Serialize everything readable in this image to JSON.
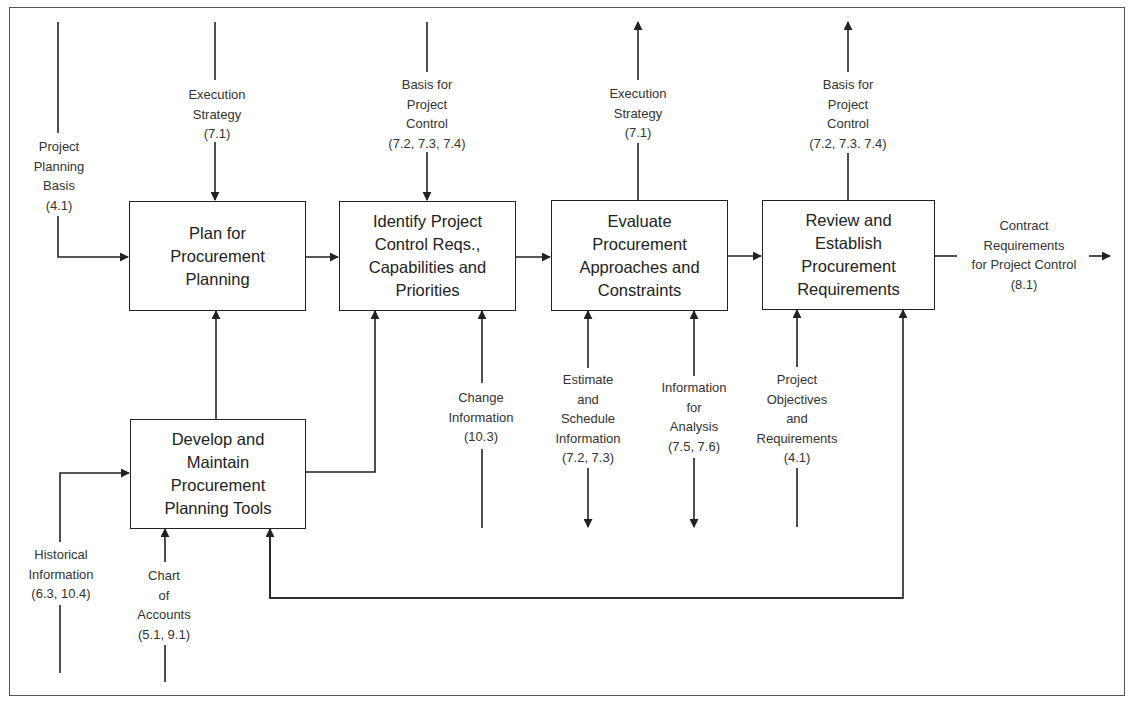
{
  "process_boxes": [
    {
      "id": "plan",
      "label": "Plan for\nProcurement\nPlanning"
    },
    {
      "id": "identify",
      "label": "Identify Project\nControl Reqs.,\nCapabilities and\nPriorities"
    },
    {
      "id": "evaluate",
      "label": "Evaluate\nProcurement\nApproaches and\nConstraints"
    },
    {
      "id": "review",
      "label": "Review and\nEstablish\nProcurement\nRequirements"
    },
    {
      "id": "develop",
      "label": "Develop and\nMaintain\nProcurement\nPlanning Tools"
    }
  ],
  "flow_labels": {
    "project_planning_basis": "Project\nPlanning\nBasis\n(4.1)",
    "execution_strategy_in": "Execution\nStrategy\n(7.1)",
    "basis_for_control_in": "Basis for\nProject\nControl\n(7.2, 7.3, 7.4)",
    "execution_strategy_out": "Execution\nStrategy\n(7.1)",
    "basis_for_control_out": "Basis for\nProject\nControl\n(7.2, 7.3. 7.4)",
    "contract_requirements": "Contract\nRequirements\nfor Project Control\n(8.1)",
    "change_information": "Change\nInformation\n(10.3)",
    "estimate_schedule": "Estimate\nand\nSchedule\nInformation\n(7.2, 7.3)",
    "information_analysis": "Information\nfor\nAnalysis\n(7.5, 7.6)",
    "project_objectives": "Project\nObjectives\nand\nRequirements\n(4.1)",
    "historical_information": "Historical\nInformation\n(6.3, 10.4)",
    "chart_of_accounts": "Chart\nof\nAccounts\n(5.1, 9.1)"
  },
  "colors": {
    "line": "#222222",
    "text": "#333333",
    "frame": "#555555"
  }
}
